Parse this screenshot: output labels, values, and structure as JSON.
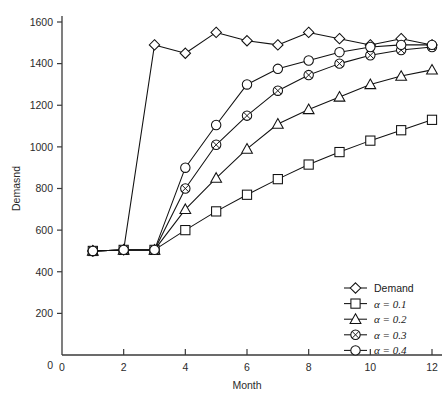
{
  "chart_data": {
    "type": "line",
    "title": "",
    "xlabel": "Month",
    "ylabel": "Demasnd",
    "xlim": [
      0,
      12
    ],
    "ylim": [
      0,
      1600
    ],
    "grid": false,
    "legend_position": "bottom-right",
    "x": [
      1,
      2,
      3,
      4,
      5,
      6,
      7,
      8,
      9,
      10,
      11,
      12
    ],
    "xticks": [
      "0",
      "2",
      "4",
      "6",
      "8",
      "10",
      "12"
    ],
    "xtick_values": [
      0,
      2,
      4,
      6,
      8,
      10,
      12
    ],
    "yticks": [
      "200",
      "400",
      "600",
      "800",
      "1000",
      "1200",
      "1400",
      "1600"
    ],
    "ytick_values": [
      200,
      400,
      600,
      800,
      1000,
      1200,
      1400,
      1600
    ],
    "series": [
      {
        "name": "Demand",
        "marker": "diamond",
        "values": [
          500,
          505,
          1490,
          1450,
          1550,
          1510,
          1490,
          1550,
          1520,
          1490,
          1520,
          1490
        ]
      },
      {
        "name": "α = 0.1",
        "marker": "square",
        "values": [
          500,
          505,
          505,
          600,
          690,
          770,
          845,
          915,
          975,
          1030,
          1080,
          1130
        ]
      },
      {
        "name": "α = 0.2",
        "marker": "triangle",
        "values": [
          500,
          505,
          505,
          700,
          850,
          990,
          1110,
          1180,
          1240,
          1300,
          1340,
          1370
        ]
      },
      {
        "name": "α = 0.3",
        "marker": "circle-x",
        "values": [
          500,
          505,
          505,
          800,
          1010,
          1150,
          1270,
          1345,
          1400,
          1440,
          1465,
          1480
        ]
      },
      {
        "name": "α = 0.4",
        "marker": "circle",
        "values": [
          500,
          505,
          505,
          900,
          1105,
          1300,
          1375,
          1415,
          1455,
          1480,
          1490,
          1490
        ]
      }
    ]
  },
  "axes": {
    "y_title": "Demasnd",
    "x_title": "Month",
    "origin_label": "0"
  },
  "legend": {
    "items": [
      {
        "label": "Demand",
        "marker": "diamond"
      },
      {
        "label": "α = 0.1",
        "marker": "square"
      },
      {
        "label": "α = 0.2",
        "marker": "triangle"
      },
      {
        "label": "α = 0.3",
        "marker": "circle-x"
      },
      {
        "label": "α = 0.4",
        "marker": "circle"
      }
    ]
  },
  "caption": {
    "text": ""
  }
}
